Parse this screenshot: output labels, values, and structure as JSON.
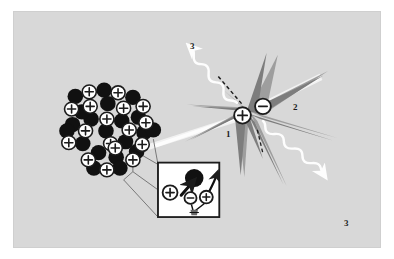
{
  "figure": {
    "background_color": "#d8d8d8",
    "outer_color": "#ffffff",
    "border_color": "#cfcfcf"
  },
  "palette": {
    "nucleon_neutron_fill": "#111111",
    "nucleon_proton_fill": "#ffffff",
    "nucleon_stroke": "#1c1c1c",
    "burst_dark_gray": "#7d7d7d",
    "burst_mid_gray": "#9e9e9e",
    "burst_light_gray": "#b4b4b4",
    "ray_white": "#fdfdfd",
    "inset_background": "#ffffff",
    "inset_border": "#1c1c1c",
    "label_color": "#1c1c1c"
  },
  "labels": [
    {
      "id": "label-1",
      "text": "1",
      "x": 212,
      "y": 118,
      "desc": "proton path marker at starburst core"
    },
    {
      "id": "label-2",
      "text": "2",
      "x": 279,
      "y": 91,
      "desc": "electron path marker at starburst core"
    },
    {
      "id": "label-3-upper",
      "text": "3",
      "x": 176,
      "y": 30,
      "desc": "gamma ray emitted upper left"
    },
    {
      "id": "label-3-lower",
      "text": "3",
      "x": 330,
      "y": 207,
      "desc": "gamma ray emitted lower right"
    }
  ],
  "nucleus": {
    "name": "atomic-nucleus-cluster",
    "charge_symbol": "+",
    "proton_count": 17,
    "neutron_count": 20,
    "protons": [
      {
        "cx": 81,
        "cy": 88,
        "r": 7.6
      },
      {
        "cx": 112,
        "cy": 89,
        "r": 7.6
      },
      {
        "cx": 62,
        "cy": 107,
        "r": 7.6
      },
      {
        "cx": 82,
        "cy": 104,
        "r": 7.6
      },
      {
        "cx": 118,
        "cy": 106,
        "r": 7.6
      },
      {
        "cx": 139,
        "cy": 104,
        "r": 7.6
      },
      {
        "cx": 100,
        "cy": 118,
        "r": 7.6
      },
      {
        "cx": 77,
        "cy": 131,
        "r": 7.6
      },
      {
        "cx": 124,
        "cy": 130,
        "r": 7.6
      },
      {
        "cx": 59,
        "cy": 144,
        "r": 7.6
      },
      {
        "cx": 104,
        "cy": 145,
        "r": 7.6
      },
      {
        "cx": 109,
        "cy": 150,
        "r": 7.6
      },
      {
        "cx": 138,
        "cy": 146,
        "r": 7.6
      },
      {
        "cx": 80,
        "cy": 163,
        "r": 7.6
      },
      {
        "cx": 128,
        "cy": 163,
        "r": 7.6
      },
      {
        "cx": 100,
        "cy": 174,
        "r": 7.6
      },
      {
        "cx": 142,
        "cy": 122,
        "r": 7.6
      }
    ],
    "neutrons": [
      {
        "cx": 97,
        "cy": 86,
        "r": 8.4
      },
      {
        "cx": 66,
        "cy": 93,
        "r": 8.4
      },
      {
        "cx": 128,
        "cy": 94,
        "r": 8.4
      },
      {
        "cx": 101,
        "cy": 101,
        "r": 8.4
      },
      {
        "cx": 83,
        "cy": 118,
        "r": 8.4
      },
      {
        "cx": 63,
        "cy": 124,
        "r": 8.4
      },
      {
        "cx": 116,
        "cy": 120,
        "r": 8.4
      },
      {
        "cx": 134,
        "cy": 116,
        "r": 8.4
      },
      {
        "cx": 99,
        "cy": 131,
        "r": 8.4
      },
      {
        "cx": 74,
        "cy": 145,
        "r": 8.4
      },
      {
        "cx": 120,
        "cy": 143,
        "r": 8.4
      },
      {
        "cx": 91,
        "cy": 155,
        "r": 8.4
      },
      {
        "cx": 140,
        "cy": 133,
        "r": 8.4
      },
      {
        "cx": 57,
        "cy": 131,
        "r": 8.4
      },
      {
        "cx": 110,
        "cy": 160,
        "r": 8.4
      },
      {
        "cx": 132,
        "cy": 154,
        "r": 8.4
      },
      {
        "cx": 86,
        "cy": 172,
        "r": 8.4
      },
      {
        "cx": 114,
        "cy": 172,
        "r": 8.4
      },
      {
        "cx": 73,
        "cy": 110,
        "r": 8.4
      },
      {
        "cx": 150,
        "cy": 130,
        "r": 8.4
      }
    ]
  },
  "inset": {
    "name": "magnified-detail-inset",
    "box": {
      "x": 154,
      "y": 165,
      "w": 68,
      "h": 62
    },
    "items": [
      {
        "id": "inset-proton-left",
        "symbol": "+",
        "cx": 168,
        "cy": 199,
        "r": 8
      },
      {
        "id": "inset-electron",
        "symbol": "−",
        "cx": 190,
        "cy": 205,
        "r": 6.5
      },
      {
        "id": "inset-proton-right",
        "symbol": "+",
        "cx": 207,
        "cy": 204,
        "r": 7
      },
      {
        "id": "inset-neutron",
        "symbol": "",
        "cx": 194,
        "cy": 183,
        "r": 10
      }
    ],
    "connector_note": "leader lines from nucleus edge to inset corners"
  },
  "starburst": {
    "name": "fission-starburst",
    "center": {
      "x": 253,
      "y": 109
    },
    "core_particles": [
      {
        "id": "burst-proton",
        "symbol": "+",
        "cx": 246,
        "cy": 114,
        "r": 9
      },
      {
        "id": "burst-electron",
        "symbol": "−",
        "cx": 268,
        "cy": 104,
        "r": 8.5
      }
    ]
  },
  "rays": [
    {
      "id": "gamma-ray-upper-left",
      "kind": "wavy",
      "color": "#fdfdfd",
      "label": "3",
      "direction": "up-left"
    },
    {
      "id": "gamma-ray-lower-right",
      "kind": "wavy",
      "color": "#fdfdfd",
      "label": "3",
      "direction": "down-right"
    },
    {
      "id": "particle-beam-lower-left",
      "kind": "streak",
      "color": "#f2f2f2",
      "label": "1",
      "direction": "lower-left"
    },
    {
      "id": "particle-beam-upper-right",
      "kind": "streak",
      "color": "#f2f2f2",
      "label": "2",
      "direction": "upper-right"
    },
    {
      "id": "trajectory-dashed",
      "kind": "dashed",
      "color": "#1c1c1c",
      "direction": "up-left"
    }
  ]
}
